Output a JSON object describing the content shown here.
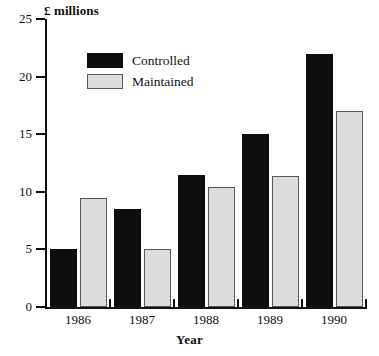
{
  "chart_data": {
    "type": "bar",
    "title": "",
    "xlabel": "Year",
    "ylabel": "£ millions",
    "categories": [
      "1986",
      "1987",
      "1988",
      "1989",
      "1990"
    ],
    "series": [
      {
        "name": "Controlled",
        "color": "#0d0d0d",
        "values": [
          5.0,
          8.5,
          11.5,
          15.0,
          22.0
        ]
      },
      {
        "name": "Maintained",
        "color": "#dcdcdc",
        "values": [
          9.5,
          5.0,
          10.4,
          11.4,
          17.0
        ]
      }
    ],
    "ylim": [
      0,
      25
    ],
    "yticks": [
      0,
      5,
      10,
      15,
      20,
      25
    ],
    "ytick_labels": [
      "0",
      "5",
      "10",
      "15",
      "20",
      "25"
    ],
    "grid": false,
    "legend_position": "upper-left-inside",
    "axis_color": "#111111",
    "background": "#ffffff"
  },
  "legend": {
    "items": [
      {
        "label": "Controlled"
      },
      {
        "label": "Maintained"
      }
    ]
  }
}
